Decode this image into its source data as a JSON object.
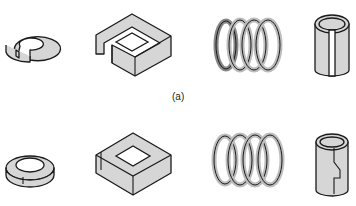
{
  "figure": {
    "label_a": "(a)",
    "rows": [
      {
        "id": "a",
        "items": [
          "split ring (open)",
          "square band (open)",
          "coil spring (open)",
          "split sleeve (open)"
        ]
      },
      {
        "id": "b",
        "items": [
          "split ring (closed)",
          "square band (closed)",
          "coil spring (closed)",
          "split sleeve (closed)"
        ]
      }
    ],
    "colors": {
      "fill": "#d9d9d9",
      "stroke": "#1a1a1a",
      "background": "#ffffff"
    }
  }
}
